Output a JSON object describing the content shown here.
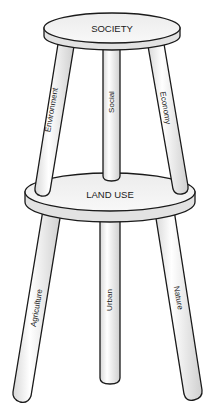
{
  "diagram": {
    "top_seat": {
      "label": "SOCIETY"
    },
    "top_legs": [
      {
        "label": "Environment",
        "position": "left"
      },
      {
        "label": "Social",
        "position": "middle"
      },
      {
        "label": "Economy",
        "position": "right"
      }
    ],
    "bottom_seat": {
      "label": "LAND USE"
    },
    "bottom_legs": [
      {
        "label": "Agriculture",
        "position": "left"
      },
      {
        "label": "Urban",
        "position": "middle"
      },
      {
        "label": "Nature",
        "position": "right"
      }
    ],
    "colors": {
      "outline": "#1a1a1a",
      "fill_light": "#f7f7f7",
      "fill_shade": "#d6d6d6",
      "background": "#ffffff"
    }
  }
}
